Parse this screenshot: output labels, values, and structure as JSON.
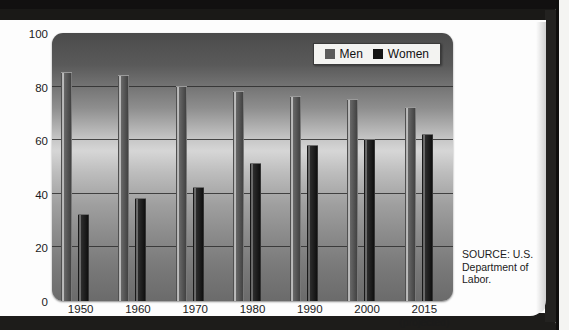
{
  "chart_data": {
    "type": "bar",
    "title": "",
    "xlabel": "",
    "ylabel": "",
    "ylim": [
      0,
      100
    ],
    "grid": true,
    "legend_position": "top-right",
    "categories": [
      "1950",
      "1960",
      "1970",
      "1980",
      "1990",
      "2000",
      "2015"
    ],
    "category_sublabels": [
      "",
      "",
      "",
      "",
      "",
      "",
      "(projected)"
    ],
    "yticks": [
      "0",
      "20",
      "40",
      "60",
      "80",
      "100"
    ],
    "ytick_values": [
      0,
      20,
      40,
      60,
      80,
      100
    ],
    "series": [
      {
        "name": "Men",
        "color": "#5b5b5b",
        "values": [
          85,
          84,
          80,
          78,
          76,
          75,
          72
        ]
      },
      {
        "name": "Women",
        "color": "#141414",
        "values": [
          32,
          38,
          42,
          51,
          58,
          60,
          62
        ]
      }
    ],
    "annotations": [
      "SOURCE: U.S. Department of Labor."
    ]
  },
  "legend": {
    "items": [
      {
        "label": "Men"
      },
      {
        "label": "Women"
      }
    ]
  },
  "source": {
    "line1": "SOURCE: U.S.",
    "line2": "Department of",
    "line3": "Labor."
  }
}
